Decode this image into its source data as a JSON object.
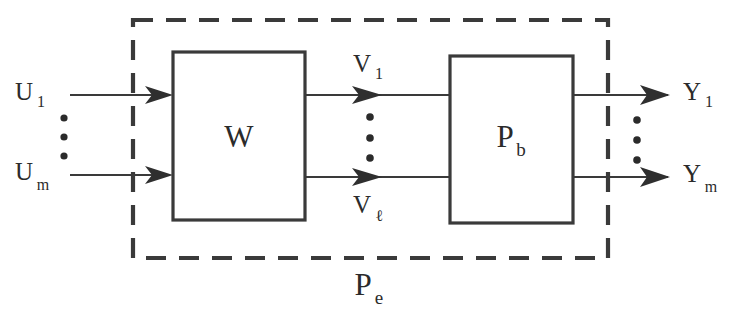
{
  "diagram": {
    "background_color": "#ffffff",
    "line_color": "#3a3a3a",
    "text_color": "#2b2b2b",
    "blocks": [
      {
        "id": "w",
        "label": "W",
        "subscript": ""
      },
      {
        "id": "pb",
        "label": "P",
        "subscript": "b"
      }
    ],
    "enclosure": {
      "label": "P",
      "subscript": "e",
      "style": "dashed"
    },
    "signals": {
      "inputs": [
        {
          "label": "U",
          "subscript": "1"
        },
        {
          "label": "U",
          "subscript": "m"
        }
      ],
      "intermediate": [
        {
          "label": "V",
          "subscript": "1"
        },
        {
          "label": "V",
          "subscript": "ℓ"
        }
      ],
      "outputs": [
        {
          "label": "Y",
          "subscript": "1"
        },
        {
          "label": "Y",
          "subscript": "m"
        }
      ]
    },
    "ellipses": [
      {
        "id": "input-ellipsis",
        "dots": 3,
        "orientation": "vertical"
      },
      {
        "id": "intermediate-ellipsis",
        "dots": 3,
        "orientation": "vertical"
      },
      {
        "id": "output-ellipsis",
        "dots": 3,
        "orientation": "vertical"
      }
    ]
  }
}
